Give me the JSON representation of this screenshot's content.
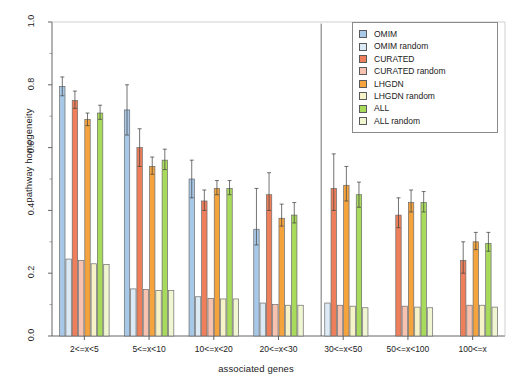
{
  "chart_data": {
    "type": "bar",
    "title": "",
    "xlabel": "associated genes",
    "ylabel": "pathway homogeneity",
    "ylim": [
      0,
      1
    ],
    "yticks": [
      0.0,
      0.2,
      0.4,
      0.6,
      0.8,
      1.0
    ],
    "ytick_labels": [
      "0.0",
      "0.2",
      "0.4",
      "0.6",
      "0.8",
      "1.0"
    ],
    "grid": false,
    "legend_position": "top-right",
    "categories": [
      "2<=x<5",
      "5<=x<10",
      "10<=x<20",
      "20<=x<30",
      "30<=x<50",
      "50<=x<100",
      "100<=x"
    ],
    "series": [
      {
        "name": "OMIM",
        "color": "#a8c8e8",
        "values": [
          0.795,
          0.72,
          0.5,
          0.34,
          null,
          null,
          null
        ],
        "err_low": [
          0.765,
          0.64,
          0.44,
          0.29,
          null,
          null,
          null
        ],
        "err_high": [
          0.825,
          0.8,
          0.56,
          0.47,
          0.995,
          null,
          null
        ]
      },
      {
        "name": "OMIM random",
        "color": "#dceaf6",
        "values": [
          0.245,
          0.15,
          0.125,
          0.105,
          0.105,
          null,
          null
        ],
        "err_low": [
          0.245,
          0.15,
          0.125,
          0.105,
          0.105,
          null,
          null
        ],
        "err_high": [
          0.245,
          0.15,
          0.125,
          0.105,
          0.105,
          null,
          null
        ]
      },
      {
        "name": "CURATED",
        "color": "#ef7f5a",
        "values": [
          0.75,
          0.6,
          0.43,
          0.45,
          0.47,
          0.385,
          0.24
        ],
        "err_low": [
          0.725,
          0.54,
          0.4,
          0.4,
          0.4,
          0.345,
          0.2
        ],
        "err_high": [
          0.78,
          0.66,
          0.465,
          0.52,
          0.58,
          0.44,
          0.3
        ]
      },
      {
        "name": "CURATED random",
        "color": "#f7c2b0",
        "values": [
          0.24,
          0.148,
          0.12,
          0.1,
          0.098,
          0.095,
          0.098
        ],
        "err_low": [
          0.24,
          0.148,
          0.12,
          0.1,
          0.098,
          0.095,
          0.098
        ],
        "err_high": [
          0.24,
          0.148,
          0.12,
          0.1,
          0.098,
          0.095,
          0.098
        ]
      },
      {
        "name": "LHGDN",
        "color": "#f5a33c",
        "values": [
          0.69,
          0.54,
          0.47,
          0.375,
          0.48,
          0.425,
          0.3
        ],
        "err_low": [
          0.67,
          0.515,
          0.45,
          0.35,
          0.43,
          0.395,
          0.275
        ],
        "err_high": [
          0.71,
          0.57,
          0.495,
          0.42,
          0.54,
          0.465,
          0.33
        ]
      },
      {
        "name": "LHGDN random",
        "color": "#f7f3c8",
        "values": [
          0.23,
          0.145,
          0.118,
          0.098,
          0.095,
          0.092,
          0.098
        ],
        "err_low": [
          0.23,
          0.145,
          0.118,
          0.098,
          0.095,
          0.092,
          0.098
        ],
        "err_high": [
          0.23,
          0.145,
          0.118,
          0.098,
          0.095,
          0.092,
          0.098
        ]
      },
      {
        "name": "ALL",
        "color": "#a8da5c",
        "values": [
          0.71,
          0.56,
          0.47,
          0.385,
          0.45,
          0.425,
          0.295
        ],
        "err_low": [
          0.69,
          0.53,
          0.45,
          0.36,
          0.41,
          0.395,
          0.27
        ],
        "err_high": [
          0.735,
          0.595,
          0.495,
          0.425,
          0.49,
          0.46,
          0.33
        ]
      },
      {
        "name": "ALL random",
        "color": "#f0f6d2",
        "values": [
          0.228,
          0.145,
          0.118,
          0.098,
          0.09,
          0.09,
          0.092
        ],
        "err_low": [
          0.228,
          0.145,
          0.118,
          0.098,
          0.09,
          0.09,
          0.092
        ],
        "err_high": [
          0.228,
          0.145,
          0.118,
          0.098,
          0.09,
          0.09,
          0.092
        ]
      }
    ]
  },
  "legend": {
    "entries": [
      {
        "label": "OMIM",
        "color": "#a8c8e8"
      },
      {
        "label": "OMIM random",
        "color": "#dceaf6"
      },
      {
        "label": "CURATED",
        "color": "#ef7f5a"
      },
      {
        "label": "CURATED random",
        "color": "#f7c2b0"
      },
      {
        "label": "LHGDN",
        "color": "#f5a33c"
      },
      {
        "label": "LHGDN random",
        "color": "#f7f3c8"
      },
      {
        "label": "ALL",
        "color": "#a8da5c"
      },
      {
        "label": "ALL random",
        "color": "#f0f6d2"
      }
    ]
  },
  "axes": {
    "y_title": "pathway homogeneity",
    "x_title": "associated genes",
    "y_tick_labels": [
      "0.0",
      "0.2",
      "0.4",
      "0.6",
      "0.8",
      "1.0"
    ],
    "x_tick_labels": [
      "2<=x<5",
      "5<=x<10",
      "10<=x<20",
      "20<=x<30",
      "30<=x<50",
      "50<=x<100",
      "100<=x"
    ]
  }
}
